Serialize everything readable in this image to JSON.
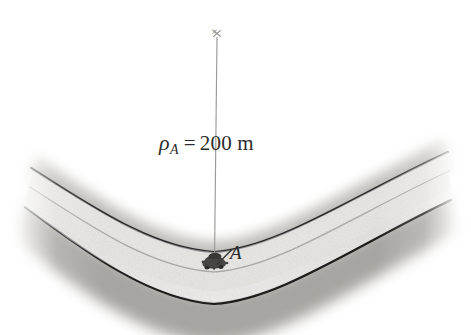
{
  "figure": {
    "kind": "engineering-diagram",
    "background_color": "#ffffff",
    "width": 471,
    "height": 335
  },
  "annotations": {
    "radius_label": {
      "symbol": "ρ",
      "subscript": "A",
      "equals": "=",
      "value": "200 m",
      "full_text": "ρA = 200 m",
      "color": "#2b2b2b"
    },
    "point_label": {
      "text": "A",
      "color": "#2b2b2b"
    },
    "center_mark": {
      "text": "×",
      "color": "#8d8d8d"
    }
  },
  "geometry": {
    "radius_line": {
      "from_x": 217,
      "from_y": 36,
      "to_x": 214,
      "to_y": 261,
      "color": "#9a9a9a"
    },
    "leader_line": {
      "from_x": 231,
      "from_y": 251,
      "to_x": 216,
      "to_y": 264,
      "color": "#3a3a3a"
    },
    "car_marker": {
      "x": 213,
      "y": 262,
      "color": "#454545"
    }
  },
  "road": {
    "edge_line_color": "#1f1f1f",
    "center_line_color": "#5a5a5a",
    "pavement_color": "#c9c7c2",
    "shoulder_top_color": "#b4b2ad",
    "shoulder_bottom_color": "#a9a7a2",
    "lanes": 2,
    "curve_direction": "concave-up"
  }
}
